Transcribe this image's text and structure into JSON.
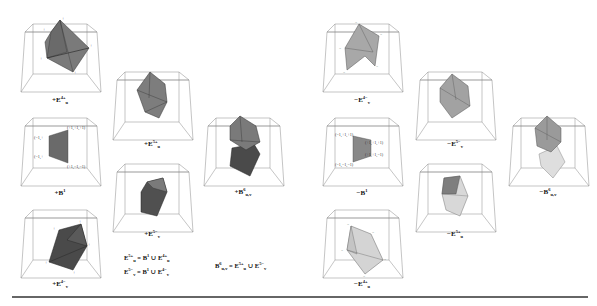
{
  "figure": {
    "left_group": {
      "sign": "+",
      "panels": [
        {
          "id": "E4_u_plus",
          "label": {
            "prefix": "+",
            "base": "E",
            "sup": "4+",
            "sub": "u"
          },
          "fill": "#7a7a7a",
          "shape": "tetra-pair"
        },
        {
          "id": "B1",
          "label": {
            "prefix": "+",
            "base": "B",
            "sup": "1",
            "sub": ""
          },
          "fill": "#6a6a6a",
          "shape": "square",
          "coords": [
            "(+1,+1,+1)",
            "(−1,+",
            "(−1,+",
            "(+1,−1,−1)"
          ]
        },
        {
          "id": "E4_v_minus",
          "label": {
            "prefix": "+",
            "base": "E",
            "sup": "4−",
            "sub": "v"
          },
          "fill": "#4a4a4a",
          "shape": "tetra-pair"
        },
        {
          "id": "E5_u_plus",
          "label": {
            "prefix": "+",
            "base": "E",
            "sup": "5+",
            "sub": "u"
          },
          "fill": "#7d7d7d",
          "shape": "bipyramid"
        },
        {
          "id": "E5_v_minus",
          "label": {
            "prefix": "+",
            "base": "E",
            "sup": "5−",
            "sub": "v"
          },
          "fill": "#505050",
          "shape": "bipyramid-b"
        },
        {
          "id": "B6_uv",
          "label": {
            "prefix": "+",
            "base": "B",
            "sup": "6",
            "sub": "u,v"
          },
          "fill_top": "#7a7a7a",
          "fill_bottom": "#4a4a4a",
          "shape": "stack"
        }
      ],
      "formulas": [
        {
          "lhs": {
            "base": "E",
            "sup": "5+",
            "sub": "u"
          },
          "rhs": "= B¹ ∪ E⁴⁺ᵤ",
          "text": "E^{5+}_u = B^1 ∪ E^{4+}_u"
        },
        {
          "lhs": {
            "base": "E",
            "sup": "5−",
            "sub": "v"
          },
          "text": "E^{5−}_v = B^1 ∪ E^{4−}_v"
        },
        {
          "text": "B^6_{u,v} = E^{5+}_u ∪ E^{5−}_v"
        }
      ]
    },
    "right_group": {
      "sign": "−",
      "panels": [
        {
          "id": "E4_v_minus_neg",
          "label": {
            "prefix": "−",
            "base": "E",
            "sup": "4−",
            "sub": "v"
          },
          "fill": "#a8a8a8",
          "shape": "tetra-pair"
        },
        {
          "id": "B1_neg",
          "label": {
            "prefix": "−",
            "base": "B",
            "sup": "1",
            "sub": ""
          },
          "fill": "#888888",
          "shape": "square",
          "coords": [
            "(−1,+1,+1)",
            "(+1,+1,+1)",
            "(+1,+1,−1)",
            "(−1,−1,−1)"
          ]
        },
        {
          "id": "E4_u_plus_neg",
          "label": {
            "prefix": "−",
            "base": "E",
            "sup": "4+",
            "sub": "u"
          },
          "fill": "#d4d4d4",
          "shape": "tetra-pair"
        },
        {
          "id": "E5_v_minus_neg",
          "label": {
            "prefix": "−",
            "base": "E",
            "sup": "5−",
            "sub": "v"
          },
          "fill": "#a2a2a2",
          "shape": "bipyramid"
        },
        {
          "id": "E5_u_plus_neg",
          "label": {
            "prefix": "−",
            "base": "E",
            "sup": "5+",
            "sub": "u"
          },
          "fill": "#d8d8d8",
          "fill_top": "#7e7e7e",
          "shape": "bipyramid-b"
        },
        {
          "id": "B6_uv_neg",
          "label": {
            "prefix": "−",
            "base": "B",
            "sup": "6",
            "sub": "u,v"
          },
          "fill_top": "#9a9a9a",
          "fill_bottom": "#dedede",
          "shape": "stack"
        }
      ]
    },
    "colors": {
      "frame": "#8a8a8a",
      "edge": "#3a3a3a",
      "rule": "#666666"
    }
  }
}
